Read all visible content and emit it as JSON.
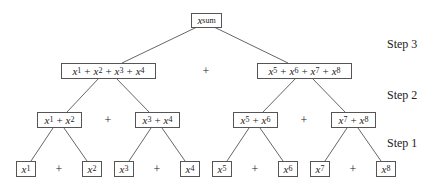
{
  "diagram": {
    "steps": [
      {
        "label": "Step 3",
        "y": 44
      },
      {
        "label": "Step 2",
        "y": 95
      },
      {
        "label": "Step 1",
        "y": 143
      }
    ],
    "root": {
      "label_base": "x",
      "label_sub": "sum"
    },
    "level3": [
      {
        "terms": [
          "1",
          "2",
          "3",
          "4"
        ]
      },
      {
        "terms": [
          "5",
          "6",
          "7",
          "8"
        ]
      }
    ],
    "level2": [
      {
        "terms": [
          "1",
          "2"
        ]
      },
      {
        "terms": [
          "3",
          "4"
        ]
      },
      {
        "terms": [
          "5",
          "6"
        ]
      },
      {
        "terms": [
          "7",
          "8"
        ]
      }
    ],
    "level1": [
      {
        "sub": "1"
      },
      {
        "sub": "2"
      },
      {
        "sub": "3"
      },
      {
        "sub": "4"
      },
      {
        "sub": "5"
      },
      {
        "sub": "6"
      },
      {
        "sub": "7"
      },
      {
        "sub": "8"
      }
    ],
    "operator": "+",
    "var": "x",
    "colors": {
      "line": "#555555",
      "text": "#222222",
      "background": "#ffffff"
    }
  }
}
